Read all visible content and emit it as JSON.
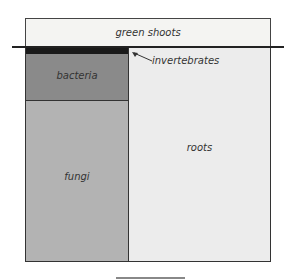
{
  "diagram": {
    "labels": {
      "green_shoots": "green shoots",
      "invertebrates": "invertebrates",
      "bacteria": "bacteria",
      "fungi": "fungi",
      "roots": "roots"
    }
  }
}
